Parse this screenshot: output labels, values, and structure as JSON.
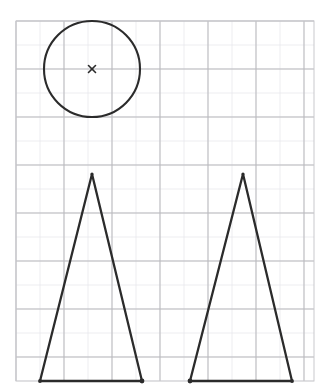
{
  "canvas": {
    "width": 331,
    "height": 388,
    "background_color": "#ffffff",
    "title": "Hand-drawn geometry worksheet on graph paper"
  },
  "grid": {
    "label": "graph paper grid",
    "origin_x": 16,
    "origin_y": 21,
    "right": 314,
    "bottom": 381,
    "minor_step": 24,
    "major_step": 48,
    "minor_color": "#e9e9ec",
    "major_color": "#b9b9bd",
    "minor_width": 0.8,
    "major_width": 1.0,
    "minor_x_positions": [
      16,
      40,
      64,
      88,
      112,
      136,
      160,
      184,
      208,
      232,
      256,
      280,
      304
    ],
    "major_x_positions": [
      16,
      64,
      112,
      160,
      208,
      256,
      304
    ],
    "minor_y_positions": [
      21,
      45,
      69,
      93,
      117,
      141,
      165,
      189,
      213,
      237,
      261,
      285,
      309,
      333,
      357,
      381
    ],
    "major_y_positions": [
      21,
      69,
      117,
      165,
      213,
      261,
      309,
      357
    ],
    "border_color": "#c9c9cd",
    "border_width": 1.0
  },
  "ink": {
    "stroke_color": "#2b2b2b",
    "stroke_width": 2.1,
    "marker_color": "#2b2b2b"
  },
  "shapes": [
    {
      "id": "circle-1",
      "name": "circle",
      "type": "circle",
      "center_x": 92,
      "center_y": 69,
      "radius": 48,
      "stroke_width": 2.1,
      "fill": "none",
      "center_marker": {
        "type": "x-cross",
        "x": 92,
        "y": 69,
        "arm": 3.5,
        "stroke_width": 1.6
      }
    },
    {
      "id": "triangle-left",
      "name": "left triangle",
      "type": "triangle",
      "points": "92,174 40,381 142,381",
      "apex_x": 92,
      "apex_y": 174,
      "base_left_x": 40,
      "base_right_x": 142,
      "base_y": 381,
      "base_width": 102,
      "height": 207,
      "stroke_width": 2.3,
      "fill": "none",
      "vertex_dots": [
        {
          "x": 92,
          "y": 174,
          "r": 1.6
        },
        {
          "x": 40,
          "y": 381,
          "r": 1.9
        },
        {
          "x": 142,
          "y": 381,
          "r": 2.4
        }
      ]
    },
    {
      "id": "triangle-right",
      "name": "right triangle",
      "type": "triangle",
      "points": "243,174 190,381 292,381",
      "apex_x": 243,
      "apex_y": 174,
      "base_left_x": 190,
      "base_right_x": 292,
      "base_y": 381,
      "base_width": 102,
      "height": 207,
      "stroke_width": 2.3,
      "fill": "none",
      "vertex_dots": [
        {
          "x": 243,
          "y": 174,
          "r": 1.6
        },
        {
          "x": 190,
          "y": 381,
          "r": 2.4
        },
        {
          "x": 292,
          "y": 381,
          "r": 1.9
        }
      ]
    }
  ]
}
